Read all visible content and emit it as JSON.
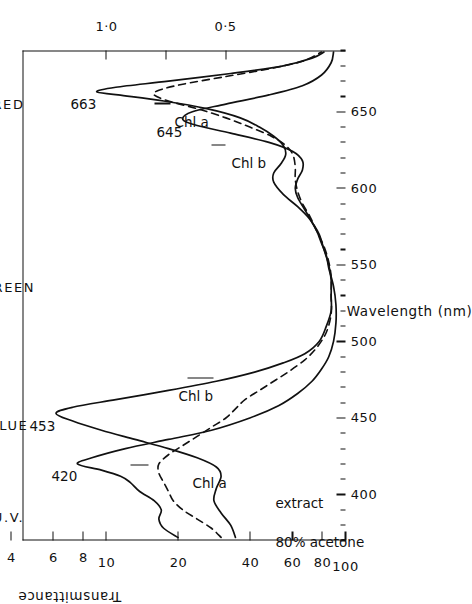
{
  "figure": {
    "kind": "absorption-spectrum",
    "orientation": "rotated-90-ccw"
  },
  "chart_data": {
    "type": "line",
    "title": "",
    "xlabel": "Wavelength (nm)",
    "ylabel": "Transmittance",
    "ylabel_secondary": "",
    "xlim": [
      370,
      690
    ],
    "grid": false,
    "legend_position": "inline-annotations",
    "axes": {
      "wavelength": {
        "label": "Wavelength (nm)",
        "unit": "nm",
        "range": [
          370,
          690
        ],
        "major_ticks": [
          400,
          450,
          500,
          550,
          600,
          650
        ],
        "major_tick_labels": [
          "400",
          "450",
          "500",
          "550",
          "600",
          "650"
        ],
        "minor_tick_step": 10
      },
      "transmittance": {
        "label": "Transmittance",
        "scale": "logarithmic",
        "range": [
          1,
          100
        ],
        "ticks": [
          1,
          2,
          4,
          6,
          8,
          10,
          20,
          40,
          60,
          80,
          100
        ],
        "tick_labels": [
          "1",
          "2",
          "4",
          "6",
          "8",
          "10",
          "20",
          "40",
          "60",
          "80",
          "100"
        ]
      },
      "absorbance": {
        "label": "",
        "scale": "linear",
        "range": [
          0.0,
          2.0
        ],
        "ticks": [
          1.0,
          0.75,
          0.5
        ],
        "tick_labels": [
          "1·0",
          "",
          "0·5"
        ]
      }
    },
    "spectral_regions": [
      {
        "label": "U.V.",
        "range": [
          370,
          400
        ]
      },
      {
        "label": "BLUE",
        "range": [
          400,
          490
        ]
      },
      {
        "label": "GREEN",
        "range": [
          490,
          580
        ]
      },
      {
        "label": "RED",
        "range": [
          620,
          690
        ]
      }
    ],
    "series": [
      {
        "name": "Chl a",
        "style": "solid",
        "annotation": "Chl a",
        "peaks": [
          {
            "wavelength": 420,
            "label": "420"
          },
          {
            "wavelength": 663,
            "label": "663"
          }
        ],
        "points": [
          [
            372,
            0.7
          ],
          [
            378,
            0.76
          ],
          [
            384,
            0.78
          ],
          [
            390,
            0.77
          ],
          [
            396,
            0.8
          ],
          [
            402,
            0.86
          ],
          [
            408,
            0.9
          ],
          [
            412,
            0.94
          ],
          [
            416,
            1.02
          ],
          [
            420,
            1.12
          ],
          [
            424,
            1.06
          ],
          [
            430,
            0.92
          ],
          [
            436,
            0.74
          ],
          [
            442,
            0.56
          ],
          [
            450,
            0.4
          ],
          [
            458,
            0.28
          ],
          [
            466,
            0.2
          ],
          [
            474,
            0.14
          ],
          [
            482,
            0.1
          ],
          [
            490,
            0.07
          ],
          [
            500,
            0.05
          ],
          [
            512,
            0.04
          ],
          [
            524,
            0.04
          ],
          [
            536,
            0.05
          ],
          [
            548,
            0.07
          ],
          [
            556,
            0.08
          ],
          [
            564,
            0.1
          ],
          [
            572,
            0.12
          ],
          [
            580,
            0.15
          ],
          [
            588,
            0.2
          ],
          [
            596,
            0.26
          ],
          [
            604,
            0.3
          ],
          [
            610,
            0.3
          ],
          [
            616,
            0.27
          ],
          [
            622,
            0.25
          ],
          [
            628,
            0.26
          ],
          [
            634,
            0.3
          ],
          [
            640,
            0.36
          ],
          [
            646,
            0.44
          ],
          [
            652,
            0.58
          ],
          [
            657,
            0.76
          ],
          [
            661,
            0.95
          ],
          [
            663,
            1.04
          ],
          [
            666,
            0.96
          ],
          [
            670,
            0.74
          ],
          [
            675,
            0.48
          ],
          [
            680,
            0.26
          ],
          [
            685,
            0.14
          ],
          [
            689,
            0.09
          ]
        ]
      },
      {
        "name": "Chl b",
        "style": "solid",
        "annotation": "Chl b",
        "peaks": [
          {
            "wavelength": 453,
            "label": "453"
          },
          {
            "wavelength": 645,
            "label": "645"
          }
        ],
        "points": [
          [
            372,
            0.46
          ],
          [
            380,
            0.48
          ],
          [
            388,
            0.52
          ],
          [
            396,
            0.55
          ],
          [
            404,
            0.54
          ],
          [
            412,
            0.52
          ],
          [
            418,
            0.54
          ],
          [
            424,
            0.62
          ],
          [
            430,
            0.74
          ],
          [
            436,
            0.88
          ],
          [
            442,
            1.02
          ],
          [
            448,
            1.14
          ],
          [
            453,
            1.21
          ],
          [
            457,
            1.14
          ],
          [
            462,
            0.96
          ],
          [
            468,
            0.74
          ],
          [
            474,
            0.54
          ],
          [
            480,
            0.38
          ],
          [
            486,
            0.26
          ],
          [
            492,
            0.17
          ],
          [
            500,
            0.11
          ],
          [
            510,
            0.08
          ],
          [
            520,
            0.06
          ],
          [
            530,
            0.06
          ],
          [
            540,
            0.06
          ],
          [
            550,
            0.07
          ],
          [
            560,
            0.09
          ],
          [
            570,
            0.11
          ],
          [
            578,
            0.14
          ],
          [
            586,
            0.17
          ],
          [
            594,
            0.2
          ],
          [
            600,
            0.21
          ],
          [
            606,
            0.2
          ],
          [
            612,
            0.18
          ],
          [
            618,
            0.18
          ],
          [
            624,
            0.22
          ],
          [
            630,
            0.32
          ],
          [
            636,
            0.48
          ],
          [
            641,
            0.62
          ],
          [
            645,
            0.68
          ],
          [
            650,
            0.64
          ],
          [
            655,
            0.5
          ],
          [
            661,
            0.32
          ],
          [
            667,
            0.18
          ],
          [
            674,
            0.1
          ],
          [
            682,
            0.06
          ],
          [
            689,
            0.05
          ]
        ]
      },
      {
        "name": "80% acetone extract",
        "style": "dashed",
        "annotation": "80% acetone extract",
        "peaks": [],
        "points": [
          [
            372,
            0.52
          ],
          [
            378,
            0.56
          ],
          [
            384,
            0.62
          ],
          [
            390,
            0.68
          ],
          [
            396,
            0.72
          ],
          [
            402,
            0.74
          ],
          [
            408,
            0.76
          ],
          [
            414,
            0.78
          ],
          [
            420,
            0.78
          ],
          [
            426,
            0.74
          ],
          [
            432,
            0.68
          ],
          [
            438,
            0.62
          ],
          [
            444,
            0.56
          ],
          [
            450,
            0.5
          ],
          [
            456,
            0.46
          ],
          [
            462,
            0.42
          ],
          [
            468,
            0.36
          ],
          [
            474,
            0.3
          ],
          [
            480,
            0.24
          ],
          [
            488,
            0.17
          ],
          [
            496,
            0.12
          ],
          [
            506,
            0.08
          ],
          [
            518,
            0.06
          ],
          [
            530,
            0.06
          ],
          [
            542,
            0.06
          ],
          [
            552,
            0.07
          ],
          [
            562,
            0.09
          ],
          [
            572,
            0.12
          ],
          [
            582,
            0.15
          ],
          [
            590,
            0.18
          ],
          [
            598,
            0.2
          ],
          [
            606,
            0.21
          ],
          [
            614,
            0.21
          ],
          [
            622,
            0.22
          ],
          [
            628,
            0.25
          ],
          [
            634,
            0.31
          ],
          [
            640,
            0.4
          ],
          [
            646,
            0.5
          ],
          [
            652,
            0.62
          ],
          [
            657,
            0.74
          ],
          [
            661,
            0.8
          ],
          [
            664,
            0.78
          ],
          [
            668,
            0.68
          ],
          [
            673,
            0.5
          ],
          [
            678,
            0.32
          ],
          [
            683,
            0.18
          ],
          [
            689,
            0.1
          ]
        ]
      }
    ],
    "annotations": [
      {
        "text": "663",
        "kind": "peak-label"
      },
      {
        "text": "645",
        "kind": "peak-label"
      },
      {
        "text": "453",
        "kind": "peak-label"
      },
      {
        "text": "420",
        "kind": "peak-label"
      },
      {
        "text": "Chl a",
        "kind": "series-callout"
      },
      {
        "text": "Chl a",
        "kind": "series-callout"
      },
      {
        "text": "Chl b",
        "kind": "series-callout"
      },
      {
        "text": "Chl b",
        "kind": "series-callout"
      },
      {
        "text": "80% acetone",
        "kind": "series-callout"
      },
      {
        "text": "extract",
        "kind": "series-callout"
      }
    ],
    "colors": {
      "ink": "#111111",
      "background": "#ffffff"
    }
  }
}
